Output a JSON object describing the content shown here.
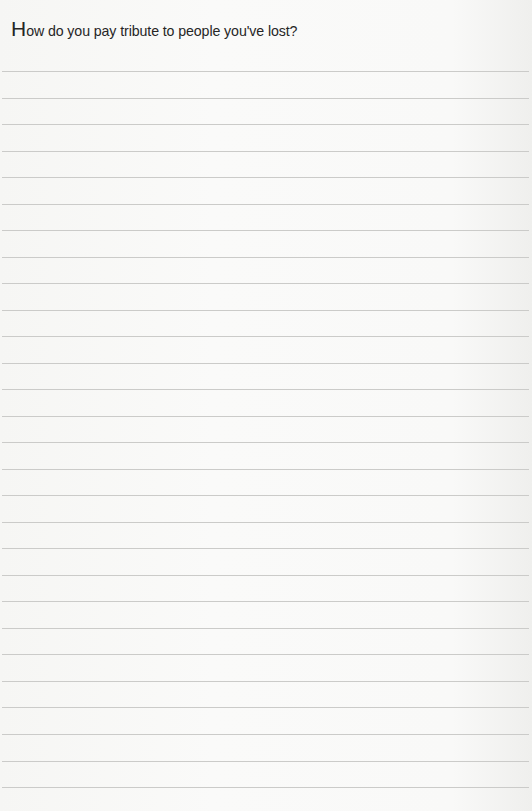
{
  "prompt": {
    "first_letter": "H",
    "rest": "ow do you pay tribute to people you've lost?",
    "full_text": "How do you pay tribute to people you've lost?"
  },
  "ruled_lines": {
    "count": 28,
    "first_y": 71,
    "spacing": 26.52,
    "color": "#cbcbc9"
  },
  "colors": {
    "background": "#f8f8f6",
    "text": "#262626"
  }
}
